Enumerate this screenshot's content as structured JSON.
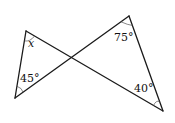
{
  "diagram": {
    "type": "geometry",
    "vertices": {
      "A": [
        26,
        31
      ],
      "B": [
        15,
        98
      ],
      "C": [
        129,
        16
      ],
      "D": [
        163,
        111
      ]
    },
    "angles": [
      {
        "vertex": "A",
        "label": "x"
      },
      {
        "vertex": "B",
        "label": "45°"
      },
      {
        "vertex": "C",
        "label": "75°"
      },
      {
        "vertex": "D",
        "label": "40°"
      }
    ]
  }
}
